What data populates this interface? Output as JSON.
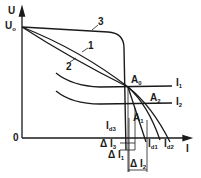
{
  "diagram": {
    "type": "voltage-current characteristic",
    "axes": {
      "y_label": "U",
      "y_start_label": "U",
      "y_start_sub": "o",
      "origin_label": "0",
      "x_label": "I"
    },
    "curves": [
      {
        "id": "1",
        "label": "1"
      },
      {
        "id": "2",
        "label": "2"
      },
      {
        "id": "3",
        "label": "3"
      }
    ],
    "load_lines": [
      {
        "label": "I",
        "sub": "1"
      },
      {
        "label": "I",
        "sub": "2"
      }
    ],
    "points": [
      {
        "label": "A",
        "sub": "0"
      },
      {
        "label": "A",
        "sub": "1"
      },
      {
        "label": "A",
        "sub": "2"
      }
    ],
    "currents": [
      {
        "label": "I",
        "sub": "d3"
      },
      {
        "label": "I",
        "sub": "d1"
      },
      {
        "label": "I",
        "sub": "d2"
      }
    ],
    "deltas": [
      {
        "label": "Δ I",
        "sub": "3"
      },
      {
        "label": "Δ I",
        "sub": "1"
      },
      {
        "label": "Δ I",
        "sub": "2"
      }
    ],
    "colors": {
      "ink": "#1a1a1a",
      "background": "#ffffff"
    }
  }
}
